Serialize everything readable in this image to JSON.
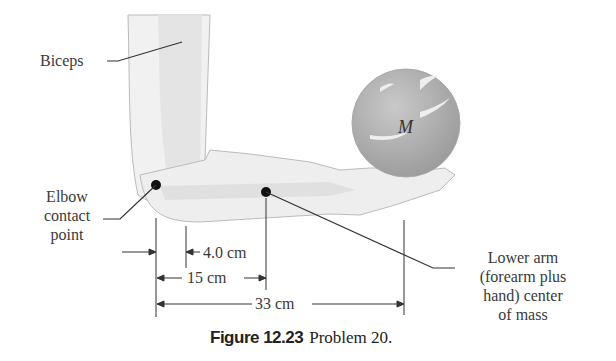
{
  "labels": {
    "biceps": "Biceps",
    "elbow_line1": "Elbow",
    "elbow_line2": "contact",
    "elbow_line3": "point",
    "mass": "M",
    "lower_arm_line1": "Lower arm",
    "lower_arm_line2": "(forearm plus",
    "lower_arm_line3": "hand) center",
    "lower_arm_line4": "of mass"
  },
  "dimensions": {
    "d1": "4.0 cm",
    "d2": "15 cm",
    "d3": "33 cm"
  },
  "caption": {
    "figure": "Figure 12.23",
    "text": "Problem 20."
  }
}
